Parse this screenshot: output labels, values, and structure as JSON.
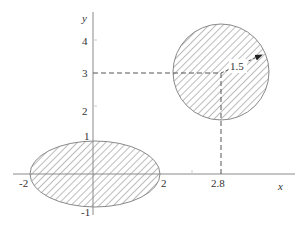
{
  "diagram": {
    "axes": {
      "x_label": "x",
      "y_label": "y",
      "x_ticks": [
        {
          "label": "-2",
          "value": -2
        },
        {
          "label": "2",
          "value": 2
        },
        {
          "label": "2.8",
          "value": 2.8
        }
      ],
      "y_ticks": [
        {
          "label": "4",
          "value": 4
        },
        {
          "label": "3",
          "value": 3
        },
        {
          "label": "2",
          "value": 2
        },
        {
          "label": "1",
          "value": 1
        },
        {
          "label": "-1",
          "value": -1
        }
      ]
    },
    "shapes": {
      "ellipse": {
        "center": [
          0,
          0
        ],
        "semi_axis_x": 2,
        "semi_axis_y": 1,
        "fill": "hatched"
      },
      "circle": {
        "center": [
          2.8,
          3
        ],
        "radius": 1.5,
        "fill": "hatched",
        "radius_label": "1.5"
      }
    },
    "guides": {
      "horizontal_dashed": "from y-axis at y=3 to circle center",
      "vertical_dashed": "from circle center down to x-axis at x=2.8"
    },
    "colors": {
      "stroke": "#8a8a8a",
      "hatch": "#7a7a7a",
      "text": "#333333",
      "background": "#ffffff"
    }
  }
}
